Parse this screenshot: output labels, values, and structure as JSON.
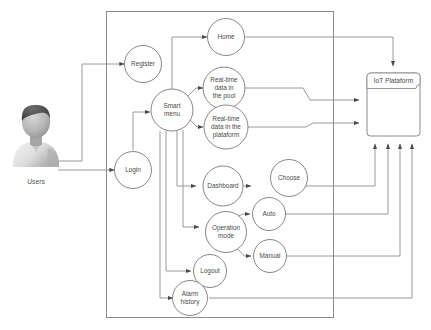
{
  "diagram": {
    "background_color": "#ffffff",
    "stroke_color": "#8a8a8a",
    "text_color": "#4a4a4a"
  },
  "actor": {
    "name": "users-actor",
    "label": "Users",
    "icon": "user-avatar-icon",
    "colors": {
      "hair": "#4b4b4b",
      "face": "#b9b9b9",
      "shirt": "#e2e2e2",
      "shadow": "#9a9a9a"
    }
  },
  "boundary": {
    "name": "system-boundary"
  },
  "platform": {
    "name": "iot-platform-node",
    "label": "IoT Plataform"
  },
  "nodes": [
    {
      "id": "register",
      "label": "Register",
      "lines": [
        "Register"
      ]
    },
    {
      "id": "login",
      "label": "Login",
      "lines": [
        "Login"
      ]
    },
    {
      "id": "smart-menu",
      "label": "Smart menu",
      "lines": [
        "Smart",
        "menu"
      ]
    },
    {
      "id": "home",
      "label": "Home",
      "lines": [
        "Home"
      ]
    },
    {
      "id": "rt-pool",
      "label": "Real-time data in the pool",
      "lines": [
        "Real-time",
        "data in",
        "the pool"
      ]
    },
    {
      "id": "rt-platform",
      "label": "Real-time data in the plataform",
      "lines": [
        "Real-time",
        "data in the",
        "plataform"
      ]
    },
    {
      "id": "dashboard",
      "label": "Dashboard",
      "lines": [
        "Dashboard"
      ]
    },
    {
      "id": "choose",
      "label": "Choose",
      "lines": [
        "Choose"
      ]
    },
    {
      "id": "operation",
      "label": "Operation mode",
      "lines": [
        "Operation",
        "mode"
      ]
    },
    {
      "id": "auto",
      "label": "Auto",
      "lines": [
        "Auto"
      ]
    },
    {
      "id": "manual",
      "label": "Manual",
      "lines": [
        "Manual"
      ]
    },
    {
      "id": "logout",
      "label": "Logout",
      "lines": [
        "Logout"
      ]
    },
    {
      "id": "alarm",
      "label": "Alarm history",
      "lines": [
        "Alarm",
        "history"
      ]
    }
  ],
  "edges": [
    {
      "from": "users",
      "to": "register"
    },
    {
      "from": "users",
      "to": "login"
    },
    {
      "from": "login",
      "to": "smart-menu"
    },
    {
      "from": "smart-menu",
      "to": "home"
    },
    {
      "from": "smart-menu",
      "to": "rt-pool"
    },
    {
      "from": "smart-menu",
      "to": "rt-platform"
    },
    {
      "from": "smart-menu",
      "to": "dashboard"
    },
    {
      "from": "smart-menu",
      "to": "operation"
    },
    {
      "from": "smart-menu",
      "to": "logout"
    },
    {
      "from": "smart-menu",
      "to": "alarm"
    },
    {
      "from": "dashboard",
      "to": "choose"
    },
    {
      "from": "operation",
      "to": "auto"
    },
    {
      "from": "operation",
      "to": "manual"
    },
    {
      "from": "home",
      "to": "platform"
    },
    {
      "from": "rt-pool",
      "to": "platform"
    },
    {
      "from": "rt-platform",
      "to": "platform"
    },
    {
      "from": "choose",
      "to": "platform"
    },
    {
      "from": "auto",
      "to": "platform"
    },
    {
      "from": "manual",
      "to": "platform"
    },
    {
      "from": "alarm",
      "to": "platform"
    }
  ]
}
